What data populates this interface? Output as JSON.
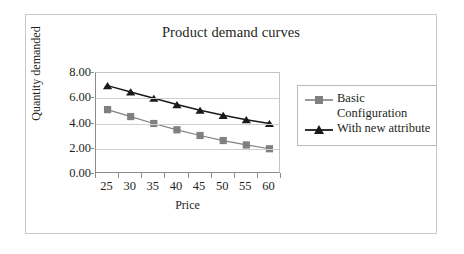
{
  "chart_data": {
    "type": "line",
    "title": "Product demand curves",
    "xlabel": "Price",
    "ylabel": "Quantity demanded",
    "x": [
      25,
      30,
      35,
      40,
      45,
      50,
      55,
      60
    ],
    "categories": [
      "25",
      "30",
      "35",
      "40",
      "45",
      "50",
      "55",
      "60"
    ],
    "xtick_labels": [
      "25",
      "30",
      "35",
      "40",
      "45",
      "50",
      "55",
      "60"
    ],
    "ytick_labels": [
      "0.00",
      "2.00",
      "4.00",
      "6.00",
      "8.00"
    ],
    "ytick_values": [
      0,
      2,
      4,
      6,
      8
    ],
    "ylim": [
      0,
      8
    ],
    "grid": true,
    "legend_position": "right",
    "series": [
      {
        "name": "Basic\nConfiguration",
        "legend_label": "Basic\nConfiguration",
        "marker": "square",
        "color": "#808080",
        "values": [
          5.1,
          4.55,
          4.0,
          3.5,
          3.05,
          2.65,
          2.3,
          2.0
        ]
      },
      {
        "name": "With new attribute",
        "legend_label": "With new attribute",
        "marker": "triangle",
        "color": "#1a1a1a",
        "values": [
          7.0,
          6.5,
          6.0,
          5.5,
          5.05,
          4.65,
          4.3,
          4.0
        ]
      }
    ]
  },
  "figure": {
    "border_color": "#c9c9c9",
    "background": "#ffffff",
    "axis_color": "#8b8b8b",
    "gridline_color": "#cfcfcf"
  }
}
